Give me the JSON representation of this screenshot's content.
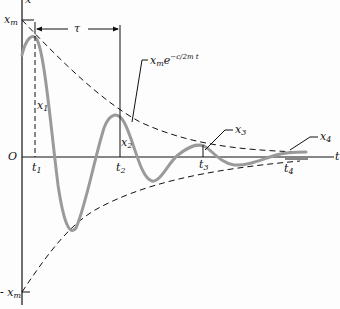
{
  "diagram": {
    "axes": {
      "y_axis_label": "x",
      "x_axis_label": "t",
      "origin_label": "O",
      "y_max_label": "x_m",
      "y_min_label": "- x_m"
    },
    "period_label": "τ",
    "envelope_label": {
      "base": "x",
      "base_sub": "m",
      "exp": "e",
      "exponent": "−c/2m t"
    },
    "time_marks": [
      "t1",
      "t2",
      "t3",
      "t4"
    ],
    "amplitude_marks": [
      "x1",
      "x2",
      "x3",
      "x4"
    ],
    "colors": {
      "curve": "#9a9a9a",
      "axes": "#111111",
      "envelope": "#111111"
    }
  }
}
